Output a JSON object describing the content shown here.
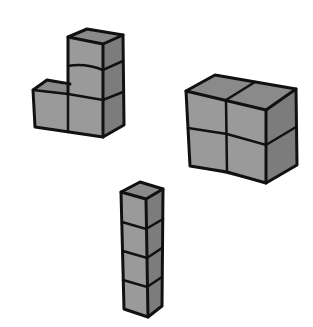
{
  "figure": {
    "colors": {
      "background": "#ffffff",
      "front_face": "#9a9a9a",
      "side_face": "#7c7c7c",
      "top_face": "#8a8a8a",
      "outline": "#111111"
    },
    "shapes": [
      {
        "name": "L-shape",
        "cubes": 4,
        "layout": "3-tall column with 1 cube attached at bottom-left"
      },
      {
        "name": "2x2 block",
        "cubes": 4,
        "layout": "2 wide by 2 tall square"
      },
      {
        "name": "tower",
        "cubes": 4,
        "layout": "4-tall single column"
      }
    ]
  }
}
